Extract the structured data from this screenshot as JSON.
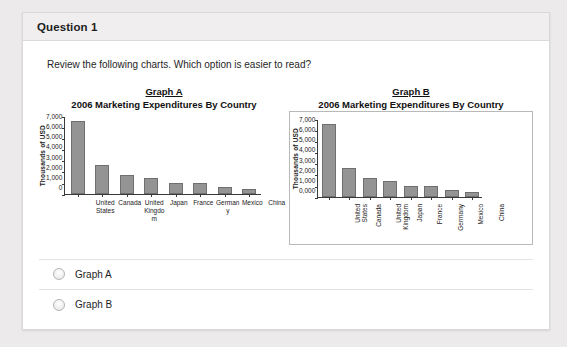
{
  "header": {
    "title": "Question 1"
  },
  "question": {
    "prompt": "Review the following charts. Which option is easier to read?"
  },
  "options": [
    {
      "label": "Graph A",
      "selected": false
    },
    {
      "label": "Graph B",
      "selected": false
    }
  ],
  "colors": {
    "page_background": "#eceaea",
    "card_background": "#ffffff",
    "header_background": "#f0eeee",
    "bar_fill": "#949494",
    "bar_stroke": "#6f6f6f",
    "axis": "#3a3a3a",
    "divider": "#e2e2e2"
  },
  "chart_data": [
    {
      "id": "graph-a",
      "type": "bar",
      "name": "Graph A",
      "title": "2006 Marketing Expenditures By Country",
      "xlabel": "",
      "ylabel": "Thousands of USD",
      "categories": [
        "United States",
        "Canada",
        "United Kingdom",
        "Japan",
        "France",
        "Germany",
        "Mexico",
        "China"
      ],
      "values": [
        6550,
        2600,
        1650,
        1400,
        930,
        930,
        650,
        420
      ],
      "ylim": [
        0,
        7000
      ],
      "yticks": [
        "7,000",
        "6,000",
        "5,000",
        "4,000",
        "3,000",
        "2,000",
        "1,000",
        "0"
      ],
      "grid": false,
      "legend": false,
      "label_orientation": "horizontal",
      "framed": false
    },
    {
      "id": "graph-b",
      "type": "bar",
      "name": "Graph B",
      "title": "2006 Marketing Expenditures By Country",
      "xlabel": "",
      "ylabel": "Thousands of USD",
      "categories": [
        "United States",
        "Canada",
        "United Kingdom",
        "Japan",
        "France",
        "Germany",
        "Mexico",
        "China"
      ],
      "values": [
        6550,
        2600,
        1650,
        1400,
        930,
        930,
        650,
        420
      ],
      "ylim": [
        0,
        7000
      ],
      "yticks": [
        "7,000",
        "6,000",
        "5,000",
        "4,000",
        "3,000",
        "2,000",
        "1,000",
        "0,000"
      ],
      "grid": false,
      "legend": false,
      "label_orientation": "vertical",
      "framed": true
    }
  ]
}
